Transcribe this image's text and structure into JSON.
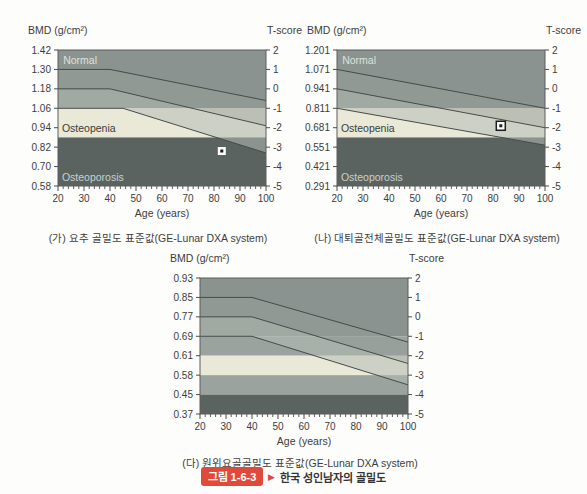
{
  "figure_caption": {
    "tag": "그림 1-6-3",
    "arrow": "▶",
    "text": "한국 성인남자의 골밀도",
    "tag_color": "#df4a3a"
  },
  "chart_data": [
    {
      "type": "area",
      "name": "lumbar-spine-bmd-reference",
      "caption": "(가) 요추 골밀도 표준값(GE-Lunar DXA system)",
      "ylabel_left": "BMD (g/cm²)",
      "ylabel_right": "T-score",
      "xlabel": "Age (years)",
      "x_range": [
        20,
        100
      ],
      "x_ticks": [
        20,
        30,
        40,
        50,
        60,
        70,
        80,
        90,
        100
      ],
      "t_range": [
        2,
        -5
      ],
      "t_ticks": [
        2,
        1,
        0,
        -1,
        -2,
        -3,
        -4,
        -5
      ],
      "bmd_tick_labels": [
        "1.42",
        "1.30",
        "1.18",
        "1.06",
        "0.94",
        "0.82",
        "0.70",
        "0.58"
      ],
      "zones": [
        {
          "name": "normal",
          "t_from": 2,
          "t_to": -1,
          "color": "#8a938f"
        },
        {
          "name": "osteopenia",
          "t_from": -1,
          "t_to": -2.5,
          "color": "#eae8d7"
        },
        {
          "name": "osteoporosis",
          "t_from": -2.5,
          "t_to": -5,
          "color": "#5a6360"
        }
      ],
      "reference_lines": [
        {
          "name": "plus-1sd",
          "points_age_t": [
            [
              20,
              1
            ],
            [
              40,
              1
            ],
            [
              100,
              -0.6
            ]
          ]
        },
        {
          "name": "mean",
          "points_age_t": [
            [
              20,
              0
            ],
            [
              40,
              0
            ],
            [
              100,
              -1.9
            ]
          ]
        },
        {
          "name": "minus-1sd",
          "points_age_t": [
            [
              20,
              -1
            ],
            [
              45,
              -1
            ],
            [
              100,
              -3.3
            ]
          ]
        }
      ],
      "band_fills": [
        {
          "between": [
            0,
            1
          ],
          "color": "rgba(150,158,152,0.55)"
        },
        {
          "between": [
            1,
            2
          ],
          "color": "rgba(180,187,180,0.55)"
        }
      ],
      "region_labels": [
        {
          "text": "Normal",
          "age": 22,
          "t": 1.5,
          "color": "#dce2de"
        },
        {
          "text": "Osteopenia",
          "age": 21.5,
          "t": -2.0,
          "color": "#383d3a"
        },
        {
          "text": "Osteoporosis",
          "age": 21.5,
          "t": -4.55,
          "color": "#c9d0cb"
        }
      ],
      "patient_marker": {
        "age": 83,
        "t": -3.2,
        "style": "white-square"
      }
    },
    {
      "type": "area",
      "name": "total-femur-bmd-reference",
      "caption": "(나) 대퇴골전체골밀도 표준값(GE-Lunar DXA system)",
      "ylabel_left": "BMD (g/cm²)",
      "ylabel_right": "T-score",
      "xlabel": "Age (years)",
      "x_range": [
        20,
        100
      ],
      "x_ticks": [
        20,
        30,
        40,
        50,
        60,
        70,
        80,
        90,
        100
      ],
      "t_range": [
        2,
        -5
      ],
      "t_ticks": [
        2,
        1,
        0,
        -1,
        -2,
        -3,
        -4,
        -5
      ],
      "bmd_tick_labels": [
        "1.201",
        "1.071",
        "0.941",
        "0.811",
        "0.681",
        "0.551",
        "0.421",
        "0.291"
      ],
      "zones": [
        {
          "name": "normal",
          "t_from": 2,
          "t_to": -1,
          "color": "#8a938f"
        },
        {
          "name": "osteopenia",
          "t_from": -1,
          "t_to": -2.5,
          "color": "#eae8d7"
        },
        {
          "name": "osteoporosis",
          "t_from": -2.5,
          "t_to": -5,
          "color": "#5a6360"
        }
      ],
      "reference_lines": [
        {
          "name": "plus-1sd",
          "points_age_t": [
            [
              20,
              1
            ],
            [
              100,
              -1
            ]
          ]
        },
        {
          "name": "mean",
          "points_age_t": [
            [
              20,
              0
            ],
            [
              100,
              -2
            ]
          ]
        },
        {
          "name": "minus-1sd",
          "points_age_t": [
            [
              20,
              -1
            ],
            [
              100,
              -2.9
            ]
          ]
        }
      ],
      "band_fills": [
        {
          "between": [
            0,
            1
          ],
          "color": "rgba(150,158,152,0.55)"
        },
        {
          "between": [
            1,
            2
          ],
          "color": "rgba(180,187,180,0.55)"
        }
      ],
      "region_labels": [
        {
          "text": "Normal",
          "age": 22,
          "t": 1.5,
          "color": "#dce2de"
        },
        {
          "text": "Osteopenia",
          "age": 21.5,
          "t": -2.0,
          "color": "#383d3a"
        },
        {
          "text": "Osteoporosis",
          "age": 21.5,
          "t": -4.55,
          "color": "#c9d0cb"
        }
      ],
      "patient_marker": {
        "age": 83,
        "t": -1.9,
        "style": "black-square"
      }
    },
    {
      "type": "area",
      "name": "distal-radius-bmd-reference",
      "caption": "(다) 원위요골골밀도 표준값(GE-Lunar DXA system)",
      "ylabel_left": "BMD (g/cm²)",
      "ylabel_right": "T-score",
      "xlabel": "Age (years)",
      "x_range": [
        20,
        100
      ],
      "x_ticks": [
        20,
        30,
        40,
        50,
        60,
        70,
        80,
        90,
        100
      ],
      "t_range": [
        2,
        -5
      ],
      "t_ticks": [
        2,
        1,
        0,
        -1,
        -2,
        -3,
        -4,
        -5
      ],
      "bmd_tick_labels": [
        "0.93",
        "0.85",
        "0.77",
        "0.69",
        "0.61",
        "0.58",
        "0.45",
        "0.37"
      ],
      "zones": [
        {
          "name": "upper",
          "t_from": 2,
          "t_to": -1,
          "color": "#8a938f"
        },
        {
          "name": "mid-upper",
          "t_from": -1,
          "t_to": -2,
          "color": "#9aa39e"
        },
        {
          "name": "osteopenia-band",
          "t_from": -2,
          "t_to": -3,
          "color": "#eae8d7"
        },
        {
          "name": "mid-lower",
          "t_from": -3,
          "t_to": -4,
          "color": "#9aa39e"
        },
        {
          "name": "osteoporosis",
          "t_from": -4,
          "t_to": -5,
          "color": "#5a6360"
        }
      ],
      "reference_lines": [
        {
          "name": "plus-1sd",
          "points_age_t": [
            [
              20,
              1
            ],
            [
              40,
              1
            ],
            [
              100,
              -1.3
            ]
          ]
        },
        {
          "name": "mean",
          "points_age_t": [
            [
              20,
              0
            ],
            [
              40,
              0
            ],
            [
              100,
              -2.4
            ]
          ]
        },
        {
          "name": "minus-1sd",
          "points_age_t": [
            [
              20,
              -1
            ],
            [
              40,
              -1
            ],
            [
              100,
              -3.5
            ]
          ]
        }
      ],
      "band_fills": [
        {
          "between": [
            0,
            1
          ],
          "color": "rgba(150,158,152,0.55)"
        },
        {
          "between": [
            1,
            2
          ],
          "color": "rgba(180,187,180,0.55)"
        }
      ],
      "region_labels": [],
      "patient_marker": null
    }
  ]
}
